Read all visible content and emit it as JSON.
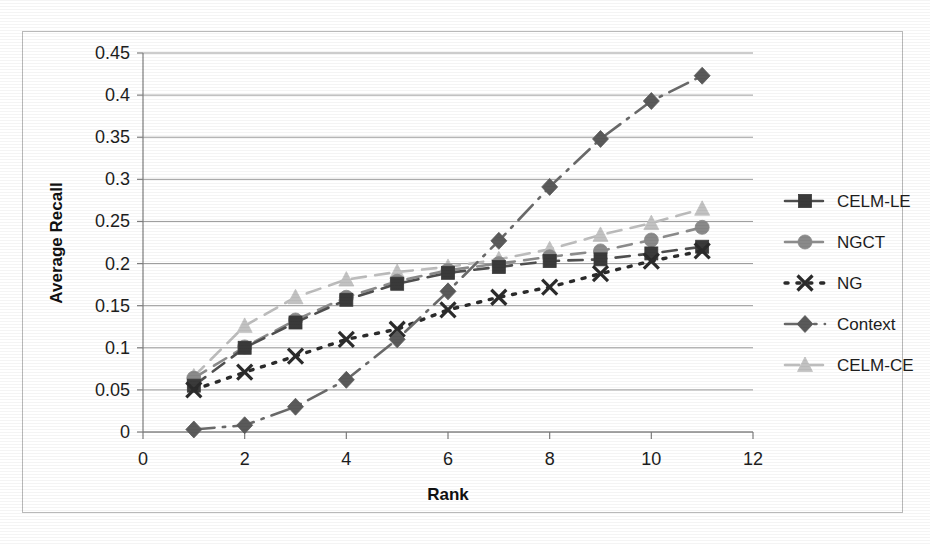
{
  "figure": {
    "background": "#ffffff",
    "frame_color": "#b9b9b9",
    "gridline_color": "#9a9a9a",
    "axis_color": "#7d7d7d",
    "text_color": "#1d1d1d"
  },
  "chart_data": {
    "type": "line",
    "title": "",
    "xlabel": "Rank",
    "ylabel": "Average Recall",
    "xlim": [
      0,
      12
    ],
    "ylim": [
      0,
      0.45
    ],
    "xticks": [
      0,
      2,
      4,
      6,
      8,
      10,
      12
    ],
    "xtick_labels": [
      "0",
      "2",
      "4",
      "6",
      "8",
      "10",
      "12"
    ],
    "yticks": [
      0,
      0.05,
      0.1,
      0.15,
      0.2,
      0.25,
      0.3,
      0.35,
      0.4,
      0.45
    ],
    "ytick_labels": [
      "0",
      "0.05",
      "0.1",
      "0.15",
      "0.2",
      "0.25",
      "0.3",
      "0.35",
      "0.4",
      "0.45"
    ],
    "grid": "horizontal",
    "legend_position": "right",
    "x": [
      1,
      2,
      3,
      4,
      5,
      6,
      7,
      8,
      9,
      10,
      11
    ],
    "series": [
      {
        "name": "CELM-LE",
        "marker": "square",
        "linestyle": "dashed",
        "color": "#4f4f4f",
        "marker_color": "#3a3a3a",
        "values": [
          0.055,
          0.1,
          0.13,
          0.157,
          0.176,
          0.189,
          0.196,
          0.203,
          0.205,
          0.212,
          0.22
        ]
      },
      {
        "name": "NGCT",
        "marker": "circle",
        "linestyle": "dashed",
        "color": "#8c8c8c",
        "marker_color": "#8a8a8a",
        "values": [
          0.064,
          0.101,
          0.133,
          0.16,
          0.179,
          0.192,
          0.2,
          0.208,
          0.215,
          0.228,
          0.243
        ]
      },
      {
        "name": "NG",
        "marker": "x",
        "linestyle": "dotted",
        "color": "#2b2b2b",
        "marker_color": "#2b2b2b",
        "values": [
          0.05,
          0.071,
          0.09,
          0.11,
          0.122,
          0.145,
          0.16,
          0.172,
          0.188,
          0.203,
          0.215
        ]
      },
      {
        "name": "Context",
        "marker": "diamond",
        "linestyle": "dashdot",
        "color": "#6a6a6a",
        "marker_color": "#5a5a5a",
        "values": [
          0.003,
          0.008,
          0.03,
          0.062,
          0.11,
          0.167,
          0.227,
          0.291,
          0.348,
          0.393,
          0.423
        ]
      },
      {
        "name": "CELM-CE",
        "marker": "triangle",
        "linestyle": "dashed",
        "color": "#bdbdbd",
        "marker_color": "#c2c2c2",
        "values": [
          0.066,
          0.126,
          0.16,
          0.181,
          0.19,
          0.196,
          0.205,
          0.217,
          0.234,
          0.248,
          0.265
        ]
      }
    ]
  },
  "legend": {
    "items": [
      {
        "label": "CELM-LE"
      },
      {
        "label": "NGCT"
      },
      {
        "label": "NG"
      },
      {
        "label": "Context"
      },
      {
        "label": "CELM-CE"
      }
    ]
  }
}
